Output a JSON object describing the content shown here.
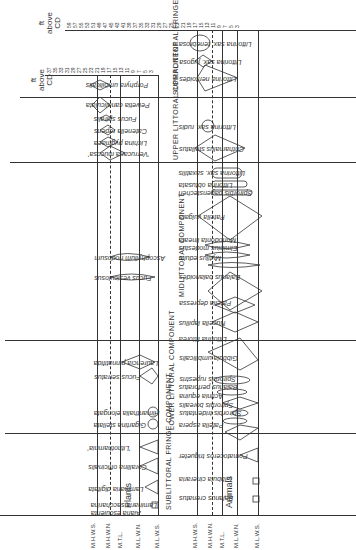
{
  "figure": {
    "orientation": "rotated 90°, text inverted",
    "plants_axis": {
      "title": [
        "ft",
        "above",
        "CD"
      ],
      "ticks": [
        "37",
        "35",
        "33",
        "31",
        "29",
        "27",
        "25",
        "23",
        "21",
        "19",
        "17",
        "15",
        "13",
        "11",
        "9",
        "7",
        "5",
        "3"
      ]
    },
    "animals_axis": {
      "title": [
        "ft",
        "above",
        "CD"
      ],
      "ticks": [
        "59",
        "57",
        "55",
        "53",
        "51",
        "49",
        "47",
        "45",
        "43",
        "41",
        "39",
        "37",
        "35",
        "33",
        "31",
        "29",
        "27",
        "25",
        "23",
        "21",
        "19",
        "17",
        "15",
        "13",
        "11",
        "9",
        "7",
        "5",
        "3"
      ]
    },
    "tide_levels": {
      "plants": [
        "M.H.W.S.",
        "M.H.W.N.",
        "M.T.L.",
        "M.L.W.N.",
        "M.L.W.S."
      ],
      "animals": [
        "M.H.W.S.",
        "M.H.W.N.",
        "M.T.L.",
        "M.L.W.N.",
        "M.L.W.S."
      ]
    },
    "group_labels": {
      "plants": "Plants",
      "animals": "Animals"
    },
    "components": {
      "supralittoral": "SUPRALITTORAL FRINGE COMPONENT",
      "upper": "UPPER LITTORAL COMPONENT",
      "mid": "MIDLITTORAL COMPONENT",
      "lower": "LOWER LITTORAL COMPONENT",
      "sublittoral": "SUBLITTORAL FRINGE COMPONENT"
    },
    "plants": [
      "Porphyra umbilicalis",
      "Pelvetia canaliculata",
      "Fucus spiralis",
      "Catenella repens",
      "Lichina pygmaea",
      "'Verrucaria mucosa'",
      "Ascophyllum nodosum",
      "Fucus vesiculosus",
      "Laurencia pinnatifida",
      "Fucus serratus",
      "Himanthalia elongata",
      "Gigartina stellata",
      "'Lithothamnia'",
      "Corallina officinalis",
      "Laminaria digitata",
      "Laminaria saccharina",
      "Alaria esculenta"
    ],
    "animals": [
      "Littorina sax. tenebrosa",
      "Littorina sax. jugosa",
      "Littorina neritoides",
      "Littorina sax. rudis",
      "Chthamalus stellatus",
      "Littorina sax. saxatilis",
      "Littorina obtusata",
      "Spirorbis pagenstecheri",
      "Patella vulgata",
      "Monodonta lineata",
      "Elminius modestus",
      "Mytilus edulis",
      "Balanus balanoides",
      "Patella depressa",
      "Nucella lapillus",
      "Littorina littorea",
      "Gibbula umbilicalis",
      "Spirorbis rupestris",
      "Balanus perforatus",
      "Actinia equina",
      "Spirorbis borealis",
      "Spirorbis tridentatus",
      "Patella aspera",
      "Pomatoceros triqueter",
      "Gibbula cineraria",
      "Balanus crenatus"
    ]
  }
}
